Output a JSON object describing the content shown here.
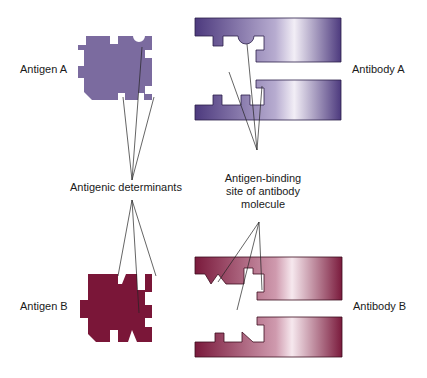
{
  "diagram": {
    "colors": {
      "antigen_a": "#7b6b9f",
      "antibody_a_dark": "#4d3a7e",
      "antibody_a_light": "#f2eef6",
      "antigen_b": "#7a1638",
      "antibody_b_dark": "#7a1a3c",
      "antibody_b_light": "#f6e8ee",
      "line": "#222222"
    },
    "labels": {
      "antigen_a": "Antigen A",
      "antibody_a": "Antibody A",
      "antigenic_determinants": "Antigenic determinants",
      "binding_site_line1": "Antigen-binding",
      "binding_site_line2": "site of antibody",
      "binding_site_line3": "molecule",
      "antigen_b": "Antigen B",
      "antibody_b": "Antibody B"
    }
  }
}
